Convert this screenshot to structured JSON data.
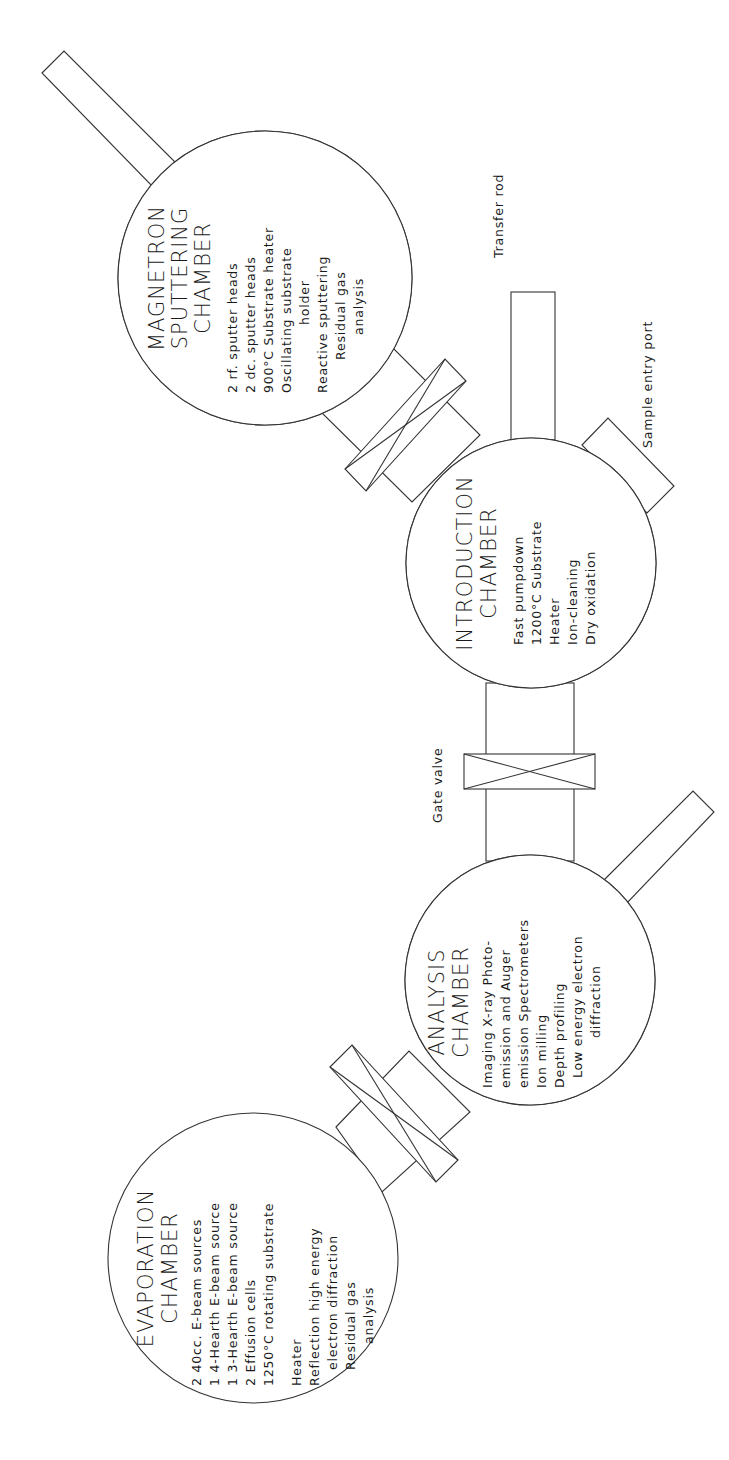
{
  "labels": {
    "transfer_rod": "Transfer rod",
    "sample_entry_port": "Sample entry port",
    "gate_valve": "Gate valve"
  },
  "chambers": {
    "magnetron": {
      "title": [
        "MAGNETRON",
        "SPUTTERING",
        "CHAMBER"
      ],
      "lines": [
        "2 rf. sputter heads",
        "2 dc. sputter heads",
        "900°C Substrate heater",
        "Oscillating substrate",
        "holder",
        "Reactive sputtering",
        "Residual gas",
        "analysis"
      ]
    },
    "introduction": {
      "title": [
        "INTRODUCTION",
        "CHAMBER"
      ],
      "lines": [
        "Fast pumpdown",
        "1200°C Substrate",
        "Heater",
        "Ion-cleaning",
        "Dry oxidation"
      ]
    },
    "analysis": {
      "title": [
        "ANALYSIS",
        "CHAMBER"
      ],
      "lines": [
        "Imaging X-ray Photo-",
        "emission and Auger",
        "emission Spectrometers",
        "Ion milling",
        "Depth profiling",
        "Low energy electron",
        "diffraction"
      ]
    },
    "evaporation": {
      "title": [
        "EVAPORATION",
        "CHAMBER"
      ],
      "lines": [
        "2 40cc. E-beam sources",
        "1 4-Hearth E-beam source",
        "1 3-Hearth E-beam source",
        "2 Effusion cells",
        "1250°C rotating substrate",
        "",
        "Heater",
        "Reflection high energy",
        "electron diffraction",
        "Residual gas",
        "analysis"
      ]
    }
  },
  "colors": {
    "line": "#333333",
    "text": "#1a1a1a",
    "background": "#ffffff"
  }
}
